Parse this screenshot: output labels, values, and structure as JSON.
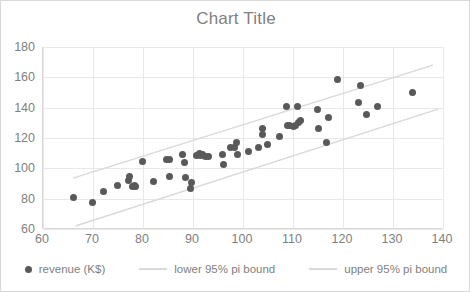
{
  "chart_data": {
    "type": "scatter",
    "title": "Chart Title",
    "xlabel": "",
    "ylabel": "",
    "xlim": [
      60,
      140
    ],
    "ylim": [
      60,
      180
    ],
    "xticks": [
      60,
      70,
      80,
      90,
      100,
      110,
      120,
      130,
      140
    ],
    "yticks": [
      60,
      80,
      100,
      120,
      140,
      160,
      180
    ],
    "grid": true,
    "legend_position": "bottom",
    "series": [
      {
        "name": "revenue (K$)",
        "type": "scatter",
        "color": "#595959",
        "points": [
          [
            66.0,
            81.0
          ],
          [
            69.8,
            77.5
          ],
          [
            72.0,
            85.0
          ],
          [
            74.9,
            89.0
          ],
          [
            77.0,
            92.0
          ],
          [
            77.3,
            94.5
          ],
          [
            77.8,
            88.0
          ],
          [
            78.2,
            88.5
          ],
          [
            78.4,
            87.8
          ],
          [
            79.9,
            104.5
          ],
          [
            82.0,
            91.5
          ],
          [
            84.7,
            105.5
          ],
          [
            85.2,
            105.8
          ],
          [
            85.3,
            94.8
          ],
          [
            87.9,
            108.8
          ],
          [
            88.3,
            104.0
          ],
          [
            88.5,
            93.8
          ],
          [
            89.4,
            86.5
          ],
          [
            89.7,
            90.8
          ],
          [
            90.7,
            108.2
          ],
          [
            91.2,
            110.0
          ],
          [
            91.5,
            108.5
          ],
          [
            91.8,
            109.2
          ],
          [
            92.4,
            107.5
          ],
          [
            93.0,
            107.8
          ],
          [
            95.8,
            108.8
          ],
          [
            96.0,
            102.5
          ],
          [
            97.5,
            113.5
          ],
          [
            98.2,
            114.0
          ],
          [
            98.6,
            116.8
          ],
          [
            98.8,
            109.0
          ],
          [
            101.0,
            110.8
          ],
          [
            103.0,
            113.5
          ],
          [
            103.8,
            122.5
          ],
          [
            103.9,
            126.0
          ],
          [
            104.8,
            116.0
          ],
          [
            107.2,
            121.0
          ],
          [
            108.6,
            141.0
          ],
          [
            108.9,
            128.5
          ],
          [
            109.3,
            128.0
          ],
          [
            110.0,
            127.5
          ],
          [
            110.4,
            128.0
          ],
          [
            110.8,
            141.0
          ],
          [
            111.0,
            130.5
          ],
          [
            111.4,
            131.5
          ],
          [
            114.8,
            138.5
          ],
          [
            115.0,
            126.5
          ],
          [
            116.7,
            117.0
          ],
          [
            117.0,
            133.5
          ],
          [
            118.9,
            158.5
          ],
          [
            123.0,
            143.5
          ],
          [
            123.5,
            154.5
          ],
          [
            124.6,
            135.5
          ],
          [
            126.8,
            140.5
          ],
          [
            133.8,
            149.8
          ]
        ]
      },
      {
        "name": "lower 95% pi bound",
        "type": "line",
        "color": "#d9d9d9",
        "endpoints": [
          [
            66.5,
            62.0
          ],
          [
            139.0,
            139.0
          ]
        ]
      },
      {
        "name": "upper 95% pi bound",
        "type": "line",
        "color": "#d9d9d9",
        "endpoints": [
          [
            66.0,
            93.5
          ],
          [
            138.0,
            168.0
          ]
        ]
      }
    ]
  },
  "legend": {
    "items": [
      {
        "label": "revenue (K$)",
        "marker": "dot"
      },
      {
        "label": "lower 95% pi bound",
        "marker": "line"
      },
      {
        "label": "upper 95% pi bound",
        "marker": "line"
      }
    ]
  }
}
